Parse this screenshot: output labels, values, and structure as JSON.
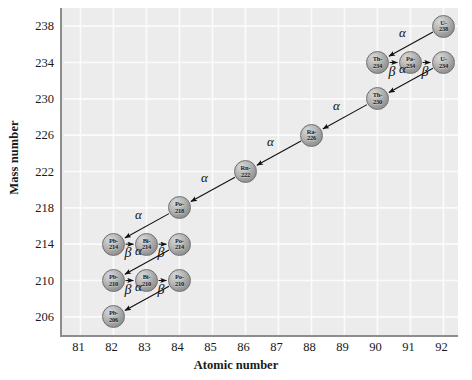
{
  "chart_data": {
    "type": "scatter",
    "title": "",
    "xlabel": "Atomic number",
    "ylabel": "Mass number",
    "xlim": [
      80.5,
      92.5
    ],
    "ylim": [
      204,
      240
    ],
    "xticks": [
      "81",
      "82",
      "83",
      "84",
      "85",
      "86",
      "87",
      "88",
      "89",
      "90",
      "91",
      "92"
    ],
    "yticks": [
      "206",
      "210",
      "214",
      "218",
      "222",
      "226",
      "230",
      "234",
      "238"
    ],
    "grid": true,
    "legend": null,
    "nodes": [
      {
        "id": "u238",
        "label_top": "U-",
        "label_bot": "238",
        "x": 92,
        "y": 238
      },
      {
        "id": "th234",
        "label_top": "Th-",
        "label_bot": "234",
        "x": 90,
        "y": 234
      },
      {
        "id": "pa234",
        "label_top": "Pa-",
        "label_bot": "234",
        "x": 91,
        "y": 234
      },
      {
        "id": "u234",
        "label_top": "U-",
        "label_bot": "234",
        "x": 92,
        "y": 234
      },
      {
        "id": "th230",
        "label_top": "Th-",
        "label_bot": "230",
        "x": 90,
        "y": 230
      },
      {
        "id": "ra226",
        "label_top": "Ra-",
        "label_bot": "226",
        "x": 88,
        "y": 226
      },
      {
        "id": "rn222",
        "label_top": "Rn-",
        "label_bot": "222",
        "x": 86,
        "y": 222
      },
      {
        "id": "po218",
        "label_top": "Po-",
        "label_bot": "218",
        "x": 84,
        "y": 218
      },
      {
        "id": "pb214",
        "label_top": "Pb-",
        "label_bot": "214",
        "x": 82,
        "y": 214
      },
      {
        "id": "bi214",
        "label_top": "Bi-",
        "label_bot": "214",
        "x": 83,
        "y": 214
      },
      {
        "id": "po214",
        "label_top": "Po-",
        "label_bot": "214",
        "x": 84,
        "y": 214
      },
      {
        "id": "pb210",
        "label_top": "Pb-",
        "label_bot": "210",
        "x": 82,
        "y": 210
      },
      {
        "id": "bi210",
        "label_top": "Bi-",
        "label_bot": "210",
        "x": 83,
        "y": 210
      },
      {
        "id": "po210",
        "label_top": "Po-",
        "label_bot": "210",
        "x": 84,
        "y": 210
      },
      {
        "id": "pb206",
        "label_top": "Pb-",
        "label_bot": "206",
        "x": 82,
        "y": 206
      }
    ],
    "decays": [
      {
        "from": "u238",
        "to": "th234",
        "type": "alpha",
        "symbol": "α"
      },
      {
        "from": "th234",
        "to": "pa234",
        "type": "beta",
        "symbol": "β"
      },
      {
        "from": "pa234",
        "to": "u234",
        "type": "beta",
        "symbol": "β"
      },
      {
        "from": "u234",
        "to": "th230",
        "type": "alpha",
        "symbol": "α"
      },
      {
        "from": "th230",
        "to": "ra226",
        "type": "alpha",
        "symbol": "α"
      },
      {
        "from": "ra226",
        "to": "rn222",
        "type": "alpha",
        "symbol": "α"
      },
      {
        "from": "rn222",
        "to": "po218",
        "type": "alpha",
        "symbol": "α"
      },
      {
        "from": "po218",
        "to": "pb214",
        "type": "alpha",
        "symbol": "α"
      },
      {
        "from": "pb214",
        "to": "bi214",
        "type": "beta",
        "symbol": "β"
      },
      {
        "from": "bi214",
        "to": "po214",
        "type": "beta",
        "symbol": "β"
      },
      {
        "from": "po214",
        "to": "pb210",
        "type": "alpha",
        "symbol": "α"
      },
      {
        "from": "pb210",
        "to": "bi210",
        "type": "beta",
        "symbol": "β"
      },
      {
        "from": "bi210",
        "to": "po210",
        "type": "beta",
        "symbol": "β"
      },
      {
        "from": "po210",
        "to": "pb206",
        "type": "alpha",
        "symbol": "α"
      }
    ],
    "colors": {
      "plot_background": "#ececec",
      "gridline": "#fbfbfb",
      "axis": "#8d8d8d",
      "node_fill": "#b0b0b0",
      "arrow": "#111111",
      "text": "#1a1a1a"
    }
  }
}
